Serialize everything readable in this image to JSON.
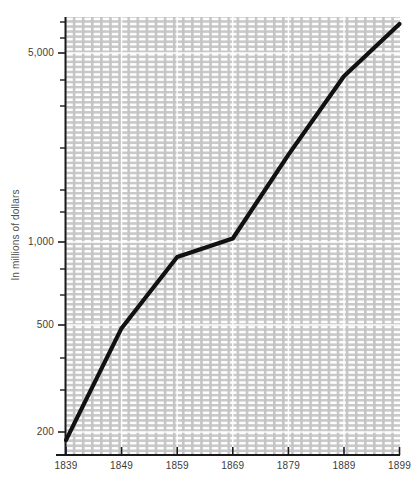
{
  "chart_data": {
    "type": "line",
    "title": "",
    "subtitle": "",
    "xlabel": "",
    "ylabel": "In millions of dollars",
    "yscale": "log",
    "xscale": "linear",
    "grid": true,
    "legend": "none",
    "xlim": [
      1839,
      1899
    ],
    "ylim": [
      170,
      7000
    ],
    "x_tick_labels": [
      "1839",
      "1849",
      "1859",
      "1869",
      "1879",
      "1889",
      "1899"
    ],
    "x_ticks": [
      1839,
      1849,
      1859,
      1869,
      1879,
      1889,
      1899
    ],
    "y_tick_labels": [
      "200",
      "500",
      "1,000",
      "5,000"
    ],
    "y_ticks": [
      200,
      500,
      1000,
      5000
    ],
    "y_minor_ticks": [
      300,
      400,
      700,
      2000,
      3000,
      4000,
      7000
    ],
    "x": [
      1839,
      1849,
      1859,
      1869,
      1879,
      1889,
      1899
    ],
    "values": [
      185,
      480,
      880,
      1030,
      2100,
      4100,
      6400
    ],
    "series": [
      {
        "name": "Value",
        "color": "#111111",
        "x": [
          1839,
          1849,
          1859,
          1869,
          1879,
          1889,
          1899
        ],
        "values": [
          185,
          480,
          880,
          1030,
          2100,
          4100,
          6400
        ]
      }
    ]
  },
  "axes": {
    "y_title": "In millions of dollars",
    "y_labels": [
      "5,000",
      "1,000",
      "500",
      "200"
    ],
    "x_labels": [
      "1839",
      "1849",
      "1859",
      "1869",
      "1879",
      "1889",
      "1899"
    ]
  },
  "colors": {
    "line": "#111111",
    "axis": "#1a1a1a",
    "grid_major": "#bdbdbd",
    "grid_minor": "#d2d2d2",
    "plot_background": "#ffffff",
    "tick_text": "#3c3c3c",
    "axis_title_text": "#4f4f4f"
  }
}
